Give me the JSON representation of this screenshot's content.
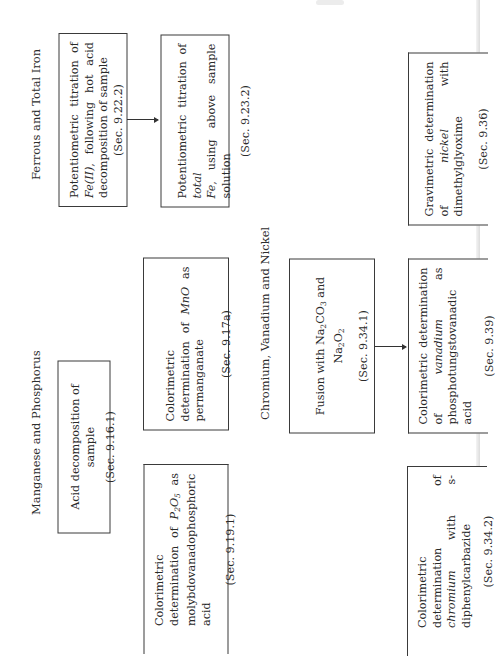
{
  "page": {
    "orientation": "rotated-90-ccw",
    "background": "#ffffff",
    "line_color": "#3a3a3a"
  },
  "sections": [
    {
      "id": "ferrous",
      "title": "Ferrous and Total Iron",
      "boxes": [
        {
          "id": "A",
          "lines": [
            "Potentiometric titration of",
            "Fe(II), following hot acid de-",
            "composition of sample"
          ],
          "italic_terms": [
            "Fe(II)"
          ],
          "section_ref": "(Sec. 9.22.2)"
        },
        {
          "id": "B",
          "lines": [
            "Potentiometric titration of total",
            "Fe, using above sample solution"
          ],
          "italic_terms": [
            "total",
            "Fe"
          ],
          "section_ref": "(Sec. 9.23.2)"
        }
      ],
      "arrows": [
        {
          "from": "A",
          "to": "B"
        }
      ]
    },
    {
      "id": "manganese",
      "title": "Manganese and Phosphorus",
      "boxes": [
        {
          "id": "C",
          "lines": [
            "Acid decomposition of sample"
          ],
          "section_ref": "(Sec. 9.16.1)"
        },
        {
          "id": "D",
          "lines": [
            "Colorimetric determination of",
            "MnO as permanganate"
          ],
          "italic_terms": [
            "MnO"
          ],
          "section_ref": "(Sec. 9.17a)"
        },
        {
          "id": "E",
          "lines": [
            "Colorimetric determination of",
            "P2O5 as molybdovanadophos-",
            "phoric acid"
          ],
          "italic_terms": [
            "P2O5"
          ],
          "section_ref": "(Sec. 9.19.1)"
        }
      ]
    },
    {
      "id": "chromium",
      "title": "Chromium, Vanadium and Nickel",
      "boxes": [
        {
          "id": "F",
          "lines": [
            "Fusion with Na2CO3 and Na2O2"
          ],
          "section_ref": "(Sec. 9.34.1)"
        },
        {
          "id": "G",
          "lines": [
            "Gravimetric determination of",
            "nickel with dimethylglyoxime"
          ],
          "italic_terms": [
            "nickel"
          ],
          "section_ref": "(Sec. 9.36)"
        },
        {
          "id": "H",
          "lines": [
            "Colorimetric determination of",
            "vanadium as phosphotungsto-",
            "vanadic acid"
          ],
          "italic_terms": [
            "vanadium"
          ],
          "section_ref": "(Sec. 9.39)"
        },
        {
          "id": "I",
          "lines": [
            "Colorimetric determination of",
            "chromium with s-diphenylcarba-",
            "zide"
          ],
          "italic_terms": [
            "chromium"
          ],
          "section_ref": "(Sec. 9.34.2)"
        }
      ],
      "arrows": [
        {
          "from": "F",
          "to": "H"
        }
      ]
    }
  ],
  "text": {
    "ferrous_title": "Ferrous and Total Iron",
    "manganese_title": "Manganese and Phosphorus",
    "chromium_title": "Chromium, Vanadium and Nickel",
    "A_pre": "Potentiometric titration of ",
    "A_it": "Fe(II)",
    "A_post": ", following hot acid de­composition of sample",
    "A_sec": "(Sec. 9.22.2)",
    "B_pre": "Potentiometric titration of ",
    "B_it1": "total",
    "B_it2": "Fe",
    "B_post": ", using above sample solution",
    "B_sec": "(Sec. 9.23.2)",
    "C_body": "Acid decomposition of sample",
    "C_sec": "(Sec. 9.16.1)",
    "D_pre": "Colorimetric determination of ",
    "D_it": "MnO",
    "D_post": " as permanganate",
    "D_sec": "(Sec. 9.17a)",
    "E_pre": "Colorimetric determination of ",
    "E_it_P": "P",
    "E_sub1": "2",
    "E_it_O": "O",
    "E_sub2": "5",
    "E_post": " as molybdovanadophos­phoric acid",
    "E_sec": "(Sec. 9.19.1)",
    "F_pre": "Fusion with Na",
    "F_s1": "2",
    "F_mid1": "CO",
    "F_s2": "3",
    "F_mid2": " and Na",
    "F_s3": "2",
    "F_mid3": "O",
    "F_s4": "2",
    "F_sec": "(Sec. 9.34.1)",
    "G_pre": "Gravimetric determination of ",
    "G_it": "nickel",
    "G_post": " with dimethylglyoxime",
    "G_sec": "(Sec. 9.36)",
    "H_pre": "Colorimetric determination of ",
    "H_it": "vanadium",
    "H_post": " as phosphotungsto­vanadic acid",
    "H_sec": "(Sec. 9.39)",
    "I_pre": "Colorimetric determination of ",
    "I_it": "chromium",
    "I_post": " with s-diphenylcarba­zide",
    "I_sec": "(Sec. 9.34.2)"
  }
}
